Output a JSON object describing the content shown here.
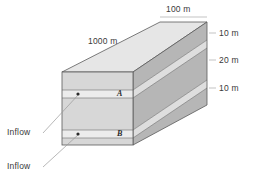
{
  "figure": {
    "name": "stratified-aquifer-block-diagram",
    "background_color": "#ffffff",
    "dimensions": {
      "length": "1000 m",
      "width": "100 m",
      "layer_top": "10 m",
      "layer_middle": "20 m",
      "layer_bottom": "10 m"
    },
    "layer_labels": {
      "upper": "A",
      "lower": "B"
    },
    "inflow_labels": {
      "upper": "Inflow",
      "lower": "Inflow"
    },
    "colors": {
      "front_thick": "#d7d7d7",
      "front_thin": "#e9e9e9",
      "top_face": "#e4e4e4",
      "side_dark": "#b6b6b6",
      "side_light": "#dcdcdc",
      "outline": "#5a5a5a",
      "text": "#3a3a3a",
      "leader": "#8d8d8d"
    }
  }
}
